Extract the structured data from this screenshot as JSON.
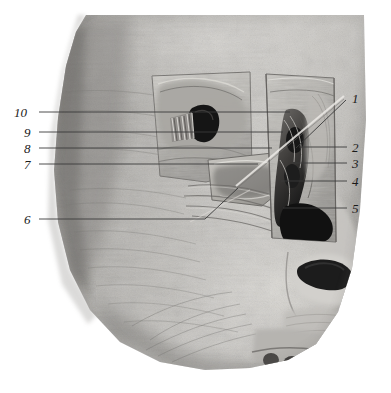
{
  "figure": {
    "type": "anatomical-dissection-photograph",
    "view": "anterolateral view of head",
    "color_mode": "grayscale",
    "background_color": "#ffffff",
    "width": 391,
    "height": 393
  },
  "palette": {
    "background": "#ffffff",
    "skin_light": "#d8d6d2",
    "skin_mid": "#b0aeaa",
    "skin_dark": "#8b8986",
    "shadow": "#5d5b58",
    "cavity": "#1b1b1b",
    "leader_line": "#3a3a3a",
    "label_text": "#1a1a1a"
  },
  "labels": [
    {
      "id": "1",
      "text": "1",
      "side": "right",
      "x": 352,
      "y": 92,
      "leader": "M346,100 L296,148"
    },
    {
      "id": "2",
      "text": "2",
      "side": "right",
      "x": 352,
      "y": 141,
      "leader": "M347,147 L299,147"
    },
    {
      "id": "3",
      "text": "3",
      "side": "right",
      "x": 352,
      "y": 157,
      "leader": "M347,163 L292,163"
    },
    {
      "id": "4",
      "text": "4",
      "side": "right",
      "x": 352,
      "y": 175,
      "leader": "M347,181 L281,181"
    },
    {
      "id": "5",
      "text": "5",
      "side": "right",
      "x": 352,
      "y": 202,
      "leader": "M347,208 L283,208"
    },
    {
      "id": "6",
      "text": "6",
      "side": "left",
      "x": 29,
      "y": 213,
      "leader": "M39,219 L205,219 L238,188"
    },
    {
      "id": "7",
      "text": "7",
      "side": "left",
      "x": 29,
      "y": 158,
      "leader": "M39,164 L258,164"
    },
    {
      "id": "8",
      "text": "8",
      "side": "left",
      "x": 29,
      "y": 142,
      "leader": "M39,148 L272,148"
    },
    {
      "id": "9",
      "text": "9",
      "side": "left",
      "x": 29,
      "y": 126,
      "leader": "M39,132 L283,132"
    },
    {
      "id": "10",
      "text": "10",
      "side": "left",
      "x": 15,
      "y": 106,
      "leader": "M39,112 L290,112"
    }
  ]
}
